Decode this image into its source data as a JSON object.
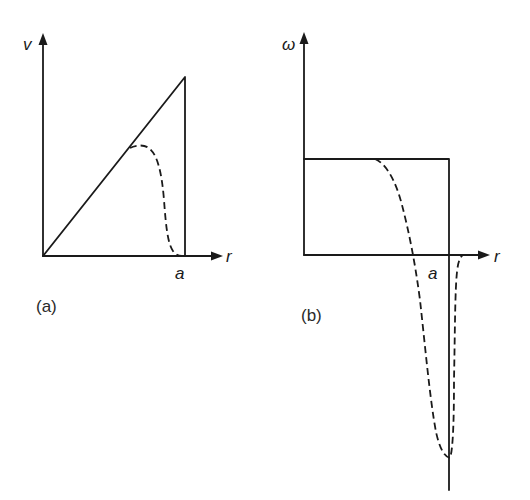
{
  "figure": {
    "panels": [
      {
        "id": "a",
        "caption": "(a)",
        "y_axis_label": "v",
        "x_axis_label": "r",
        "x_marker_label": "a",
        "description": "Velocity profile: solid line rising linearly from origin to r = a then dropping vertically to zero (Rankine vortex); dashed smooth curve following the linear part then decaying to zero before a."
      },
      {
        "id": "b",
        "caption": "(b)",
        "y_axis_label": "ω",
        "x_axis_label": "r",
        "x_marker_label": "a",
        "description": "Vorticity profile: solid constant value up to r = a, then vertical line downward; dashed curve drops from constant level through zero to a deep negative minimum near r = a, then returns to zero."
      }
    ]
  },
  "colors": {
    "ink": "#1a1a1a",
    "background": "#ffffff"
  }
}
